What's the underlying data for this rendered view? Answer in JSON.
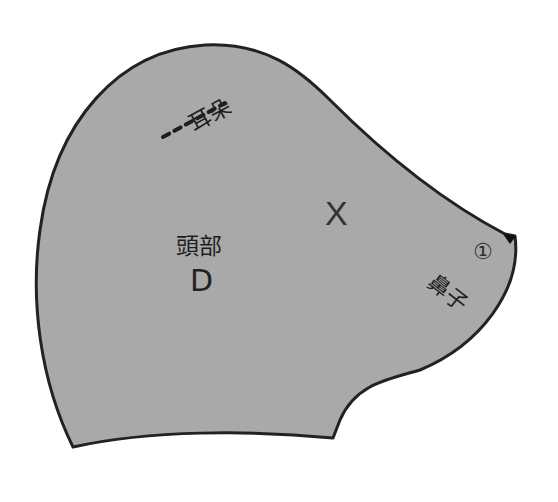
{
  "diagram": {
    "type": "sewing-pattern-piece",
    "piece_fill": "#a9a9a9",
    "outline_color": "#222222",
    "labels": {
      "ear": "耳朵",
      "part_name": "頭部",
      "part_letter": "D",
      "mark": "X",
      "notch_number": "①",
      "nose": "鼻子"
    },
    "markers": {
      "ear_line": "dashed",
      "nose_notch": "triangle"
    }
  }
}
